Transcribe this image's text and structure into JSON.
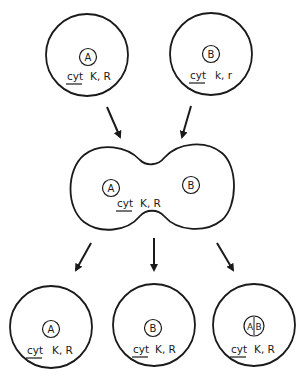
{
  "diagram": {
    "type": "cell-fusion-segregation",
    "stroke_color": "#1a1a1a",
    "background": "#ffffff",
    "parents": [
      {
        "id": "parent-a",
        "nucleus": "A",
        "cytoplasm_label": "cyt",
        "genes": "K, R"
      },
      {
        "id": "parent-b",
        "nucleus": "B",
        "cytoplasm_label": "cyt",
        "genes": "k, r"
      }
    ],
    "fusion": {
      "nuclei": [
        "A",
        "B"
      ],
      "cytoplasm_label": "cyt",
      "genes": "K, R"
    },
    "progeny": [
      {
        "id": "progeny-a",
        "nucleus": "A",
        "cytoplasm_label": "cyt",
        "genes": "K, R"
      },
      {
        "id": "progeny-b",
        "nucleus": "B",
        "cytoplasm_label": "cyt",
        "genes": "K, R"
      },
      {
        "id": "progeny-ab",
        "nucleus": "A|B",
        "nucleus_left": "A",
        "nucleus_right": "B",
        "cytoplasm_label": "cyt",
        "genes": "K, R"
      }
    ],
    "arrows": [
      {
        "from": "parent-a",
        "to": "fusion"
      },
      {
        "from": "parent-b",
        "to": "fusion"
      },
      {
        "from": "fusion",
        "to": "progeny-a"
      },
      {
        "from": "fusion",
        "to": "progeny-b"
      },
      {
        "from": "fusion",
        "to": "progeny-ab"
      }
    ]
  }
}
